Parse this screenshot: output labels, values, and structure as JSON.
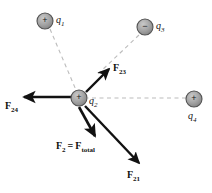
{
  "figure": {
    "type": "physics-force-diagram",
    "background_color": "#ffffff",
    "arrow_color": "#111111",
    "dashed_line_color": "#b9b9b9",
    "charge_fill_color": "#9a9a9a",
    "charge_stroke_color": "#4d4d4d"
  },
  "charges": [
    {
      "id": "q1",
      "label": "q",
      "subscript": "1",
      "sign": "+",
      "sign_glyph": "+",
      "x": 45,
      "y": 21,
      "radius": 8,
      "label_x": 56,
      "label_y": 17
    },
    {
      "id": "q3",
      "label": "q",
      "subscript": "3",
      "sign": "−",
      "sign_glyph": "−",
      "x": 145,
      "y": 27,
      "radius": 8,
      "label_x": 156,
      "label_y": 23
    },
    {
      "id": "q2",
      "label": "q",
      "subscript": "2",
      "sign": "+",
      "sign_glyph": "+",
      "x": 79,
      "y": 98,
      "radius": 8,
      "label_x": 89,
      "label_y": 101
    },
    {
      "id": "q4",
      "label": "q",
      "subscript": "4",
      "sign": "+",
      "sign_glyph": "+",
      "x": 194,
      "y": 99,
      "radius": 8,
      "label_x": 188,
      "label_y": 113
    }
  ],
  "dashed_lines": [
    {
      "id": "line-q1-q2",
      "x1": 50,
      "y1": 29,
      "x2": 76,
      "y2": 90
    },
    {
      "id": "line-q3-q2",
      "x1": 139,
      "y1": 35,
      "x2": 98,
      "y2": 74
    },
    {
      "id": "line-q4-q2",
      "x1": 186,
      "y1": 98,
      "x2": 88,
      "y2": 98
    }
  ],
  "forces": [
    {
      "id": "F23",
      "symbol": "F",
      "subscript": "23",
      "description": "force on q2 from q3, attractive, toward q3",
      "tail_x": 86,
      "tail_y": 92,
      "head_x": 110,
      "head_y": 68,
      "label_x": 114,
      "label_y": 66
    },
    {
      "id": "F24",
      "symbol": "F",
      "subscript": "24",
      "description": "force on q2 from q4, repulsive, pointing left",
      "tail_x": 72,
      "tail_y": 97,
      "head_x": 21,
      "head_y": 97,
      "label_x": 6,
      "label_y": 101
    },
    {
      "id": "F21",
      "symbol": "F",
      "subscript": "21",
      "description": "force on q2 from q1, repulsive, pointing down-right",
      "tail_x": 84,
      "tail_y": 106,
      "head_x": 141,
      "head_y": 166,
      "label_x": 128,
      "label_y": 172
    },
    {
      "id": "F2",
      "symbol": "F",
      "subscript": "2",
      "equals": "=",
      "symbol2": "F",
      "subscript2": "total",
      "description": "net total force on q2",
      "tail_x": 79,
      "tail_y": 107,
      "head_x": 96,
      "head_y": 139,
      "label_x": 57,
      "label_y": 142
    }
  ],
  "labels": {
    "f23": {
      "symbol": "F",
      "sub": "23"
    },
    "f24": {
      "symbol": "F",
      "sub": "24"
    },
    "f21": {
      "symbol": "F",
      "sub": "21"
    },
    "f2_total": {
      "symbol": "F",
      "sub": "2",
      "equals": "=",
      "symbol2": "F",
      "sub2": "total"
    },
    "q1": {
      "symbol": "q",
      "sub": "1"
    },
    "q2": {
      "symbol": "q",
      "sub": "2"
    },
    "q3": {
      "symbol": "q",
      "sub": "3"
    },
    "q4": {
      "symbol": "q",
      "sub": "4"
    }
  },
  "signs": {
    "plus": "+",
    "minus": "−"
  }
}
